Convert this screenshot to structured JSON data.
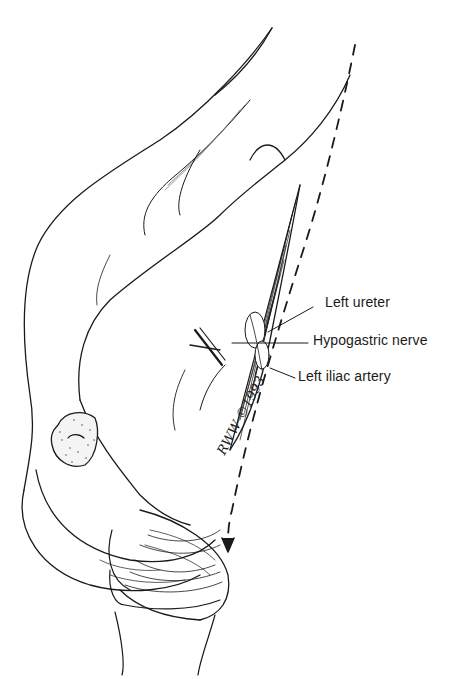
{
  "figure": {
    "type": "anatomical line illustration",
    "labels": [
      {
        "id": "left-ureter",
        "text": "Left ureter"
      },
      {
        "id": "hypogastric-nerve",
        "text": "Hypogastric nerve"
      },
      {
        "id": "left-iliac-artery",
        "text": "Left iliac artery"
      }
    ],
    "signature": "RWW ©1993",
    "colors": {
      "ink": "#1a1a1a",
      "background": "#ffffff"
    }
  }
}
